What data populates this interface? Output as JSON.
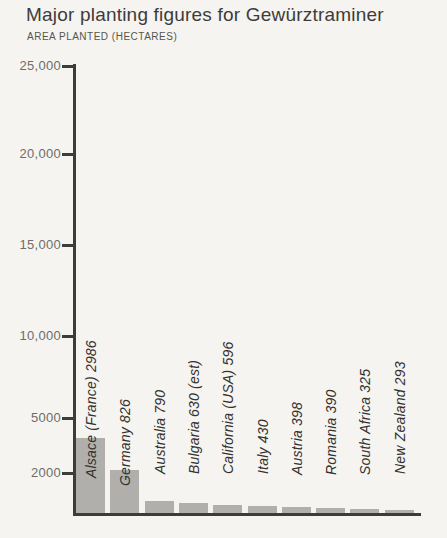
{
  "header": {
    "title": "Major planting figures for Gewürztraminer",
    "subtitle": "AREA PLANTED (HECTARES)"
  },
  "colors": {
    "background": "#f5f4f1",
    "bar": "#b0afab",
    "axis": "#3e3c39",
    "title_text": "#3e3c39",
    "subtitle_text": "#56544f",
    "tick_text": "#6f6d68",
    "bar_label_text": "#34322f"
  },
  "chart_data": {
    "type": "bar",
    "title": "Major planting figures for Gewürztraminer",
    "ylabel": "AREA PLANTED (HECTARES)",
    "xlabel": "",
    "ylim": [
      0,
      25000
    ],
    "grid": false,
    "legend": "none",
    "categories": [
      "Alsace (France)",
      "Germany",
      "Australia",
      "Bulgaria",
      "California (USA)",
      "Italy",
      "Austria",
      "Romania",
      "South Africa",
      "New Zealand"
    ],
    "values": [
      2986,
      826,
      790,
      630,
      596,
      430,
      398,
      390,
      325,
      293
    ],
    "bar_labels": [
      "Alsace (France) 2986",
      "Germany 826",
      "Australia 790",
      "Bulgaria 630 (est)",
      "California (USA) 596",
      "Italy 430",
      "Austria 398",
      "Romania 390",
      "South Africa 325",
      "New Zealand 293"
    ],
    "y_ticks": [
      "25,000",
      "20,000",
      "15,000",
      "10,000",
      "5000",
      "2000"
    ],
    "y_tick_values": [
      25000,
      20000,
      15000,
      10000,
      5000,
      2000
    ],
    "render": {
      "tick_y_px": [
        66,
        154,
        245,
        336,
        418,
        473
      ],
      "bar_start_px": 76,
      "bar_pitch_px": 34.3,
      "bar_width_px": 29,
      "baseline_y_px": 513,
      "bar_tops_px": [
        438,
        470,
        501,
        503,
        505,
        506,
        507,
        508,
        509,
        510
      ],
      "label_bottom_px": [
        478,
        486,
        474,
        474,
        474,
        474,
        475,
        475,
        475,
        474
      ]
    }
  }
}
